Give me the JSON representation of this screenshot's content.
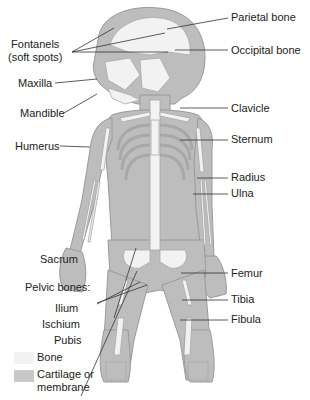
{
  "diagram": {
    "colors": {
      "cartilage": "#bdbdbd",
      "bone": "#f2f2f2",
      "outline": "#9a9a9a",
      "leader": "#333333"
    },
    "labels_left": [
      {
        "id": "fontanels",
        "text": "Fontanels",
        "text2": "(soft spots)"
      },
      {
        "id": "maxilla",
        "text": "Maxilla"
      },
      {
        "id": "mandible",
        "text": "Mandible"
      },
      {
        "id": "humerus",
        "text": "Humerus"
      },
      {
        "id": "sacrum",
        "text": "Sacrum"
      },
      {
        "id": "pelvic",
        "text": "Pelvic bones:"
      },
      {
        "id": "ilium",
        "text": "Ilium"
      },
      {
        "id": "ischium",
        "text": "Ischium"
      },
      {
        "id": "pubis",
        "text": "Pubis"
      }
    ],
    "labels_right": [
      {
        "id": "parietal",
        "text": "Parietal bone"
      },
      {
        "id": "occipital",
        "text": "Occipital bone"
      },
      {
        "id": "clavicle",
        "text": "Clavicle"
      },
      {
        "id": "sternum",
        "text": "Sternum"
      },
      {
        "id": "radius",
        "text": "Radius"
      },
      {
        "id": "ulna",
        "text": "Ulna"
      },
      {
        "id": "femur",
        "text": "Femur"
      },
      {
        "id": "tibia",
        "text": "Tibia"
      },
      {
        "id": "fibula",
        "text": "Fibula"
      }
    ],
    "legend": [
      {
        "id": "bone",
        "text": "Bone"
      },
      {
        "id": "cartilage",
        "text": "Cartilage or",
        "text2": "membrane"
      }
    ]
  }
}
